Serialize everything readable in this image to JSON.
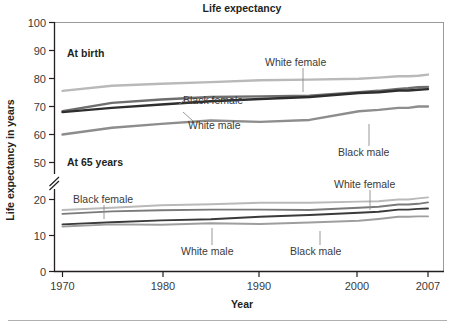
{
  "chart_data": {
    "type": "line",
    "title": "Life expectancy",
    "xlabel": "Year",
    "ylabel": "Life expectancy in years",
    "grid": false,
    "legend_position": "inline-annotations",
    "xlim": [
      1970,
      2007
    ],
    "xticks": [
      1970,
      1980,
      1990,
      2000,
      2007
    ],
    "xtick_labels": [
      "1970",
      "1980",
      "1990",
      "2000",
      "2007"
    ],
    "ylim": [
      0,
      100
    ],
    "yticks": [
      0,
      10,
      20,
      50,
      60,
      70,
      80,
      90,
      100
    ],
    "ytick_labels": [
      "0",
      "10",
      "20",
      "50",
      "60",
      "70",
      "80",
      "90",
      "100"
    ],
    "y_axis_break": {
      "from": 20,
      "to": 50,
      "style": "double-slash"
    },
    "panels": [
      {
        "name": "At birth",
        "label": "At birth"
      },
      {
        "name": "At 65 years",
        "label": "At 65 years"
      }
    ],
    "x": [
      1970,
      1975,
      1980,
      1985,
      1990,
      1995,
      2000,
      2002,
      2004,
      2005,
      2006,
      2007
    ],
    "series": [
      {
        "name": "White female",
        "panel": "At birth",
        "color": "#b9b9b9",
        "values": [
          75.6,
          77.4,
          78.1,
          78.7,
          79.4,
          79.6,
          79.9,
          80.3,
          80.8,
          80.8,
          81.0,
          81.4
        ]
      },
      {
        "name": "Black female",
        "panel": "At birth",
        "color": "#6e6e6e",
        "values": [
          68.3,
          71.3,
          72.5,
          73.4,
          73.6,
          73.9,
          75.1,
          75.6,
          76.3,
          76.5,
          76.9,
          77.0
        ]
      },
      {
        "name": "White male",
        "panel": "At birth",
        "color": "#2e2e2e",
        "values": [
          68.0,
          69.5,
          70.7,
          71.9,
          72.7,
          73.4,
          74.8,
          75.1,
          75.7,
          75.7,
          76.0,
          76.2
        ]
      },
      {
        "name": "Black male",
        "panel": "At birth",
        "color": "#8d8d8d",
        "values": [
          60.0,
          62.4,
          63.8,
          65.0,
          64.5,
          65.2,
          68.3,
          68.8,
          69.5,
          69.5,
          70.0,
          70.0
        ]
      },
      {
        "name": "White female",
        "panel": "At 65 years",
        "color": "#b9b9b9",
        "values": [
          17.1,
          17.7,
          18.4,
          18.7,
          19.1,
          19.1,
          19.4,
          19.5,
          20.0,
          20.0,
          20.3,
          20.6
        ]
      },
      {
        "name": "Black female",
        "panel": "At 65 years",
        "color": "#7a7a7a",
        "values": [
          16.0,
          16.7,
          17.0,
          17.2,
          17.2,
          17.1,
          17.7,
          18.0,
          18.6,
          18.6,
          18.8,
          19.2
        ]
      },
      {
        "name": "White male",
        "panel": "At 65 years",
        "color": "#3a3a3a",
        "values": [
          13.1,
          13.7,
          14.2,
          14.5,
          15.2,
          15.7,
          16.3,
          16.6,
          17.2,
          17.2,
          17.4,
          17.5
        ]
      },
      {
        "name": "Black male",
        "panel": "At 65 years",
        "color": "#9e9e9e",
        "values": [
          12.5,
          13.1,
          13.0,
          13.4,
          13.2,
          13.6,
          14.1,
          14.6,
          15.2,
          15.2,
          15.3,
          15.3
        ]
      }
    ],
    "annotations": [
      {
        "text": "At birth",
        "kind": "panel-heading"
      },
      {
        "text": "At 65 years",
        "kind": "panel-heading"
      },
      {
        "text": "White female",
        "kind": "series-callout",
        "panel": "At birth"
      },
      {
        "text": "Black female",
        "kind": "series-callout",
        "panel": "At birth"
      },
      {
        "text": "White male",
        "kind": "series-callout",
        "panel": "At birth"
      },
      {
        "text": "Black male",
        "kind": "series-callout",
        "panel": "At birth"
      },
      {
        "text": "Black female",
        "kind": "series-callout",
        "panel": "At 65 years"
      },
      {
        "text": "White female",
        "kind": "series-callout",
        "panel": "At 65 years"
      },
      {
        "text": "White male",
        "kind": "series-callout",
        "panel": "At 65 years"
      },
      {
        "text": "Black male",
        "kind": "series-callout",
        "panel": "At 65 years"
      }
    ]
  },
  "labels": {
    "title": "Life expectancy",
    "xlabel": "Year",
    "ylabel": "Life expectancy in years",
    "panel_at_birth": "At birth",
    "panel_at_65": "At 65 years",
    "y0": "0",
    "y10": "10",
    "y20": "20",
    "y50": "50",
    "y60": "60",
    "y70": "70",
    "y80": "80",
    "y90": "90",
    "y100": "100",
    "x1970": "1970",
    "x1980": "1980",
    "x1990": "1990",
    "x2000": "2000",
    "x2007": "2007",
    "callout_birth_white_female": "White female",
    "callout_birth_black_female": "Black female",
    "callout_birth_white_male": "White male",
    "callout_birth_black_male": "Black male",
    "callout_65_black_female": "Black female",
    "callout_65_white_female": "White female",
    "callout_65_white_male": "White male",
    "callout_65_black_male": "Black male"
  },
  "colors": {
    "white_female": "#b9b9b9",
    "black_female": "#6e6e6e",
    "white_male": "#2e2e2e",
    "black_male": "#8d8d8d",
    "axis": "#231f20",
    "border": "#9a9a9a",
    "text": "#231f20",
    "tick_text": "#3a3a3a",
    "footer_rule": "#b0b0b0"
  }
}
